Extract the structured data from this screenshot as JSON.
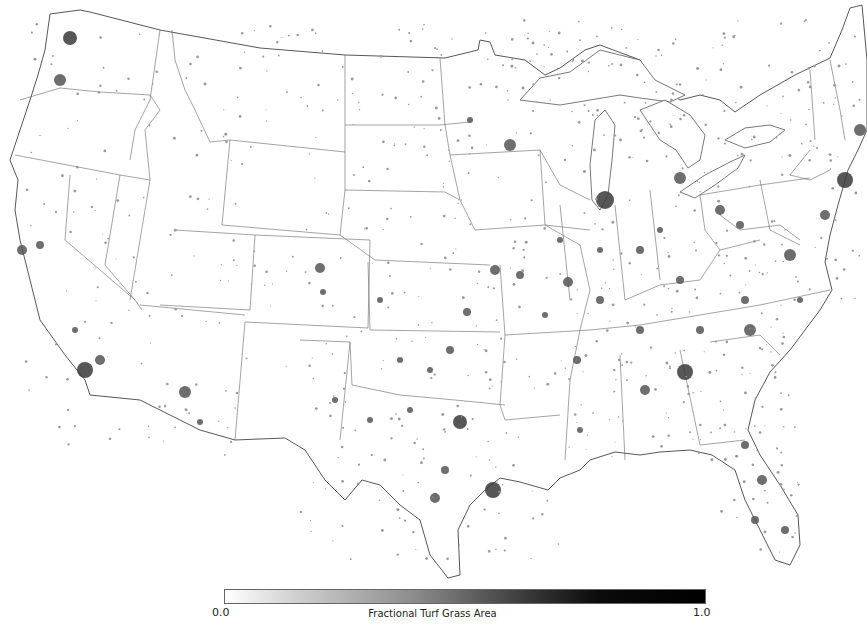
{
  "map": {
    "title": "Fractional Turf Grass Area",
    "region": "Contiguous United States",
    "background_color": "#ffffff",
    "urban_color": "#555555"
  },
  "legend": {
    "title": "Fractional Turf Grass Area",
    "min_label": "0.0",
    "max_label": "1.0",
    "min_value": 0.0,
    "max_value": 1.0,
    "colormap": [
      "#ffffff",
      "#000000"
    ]
  }
}
